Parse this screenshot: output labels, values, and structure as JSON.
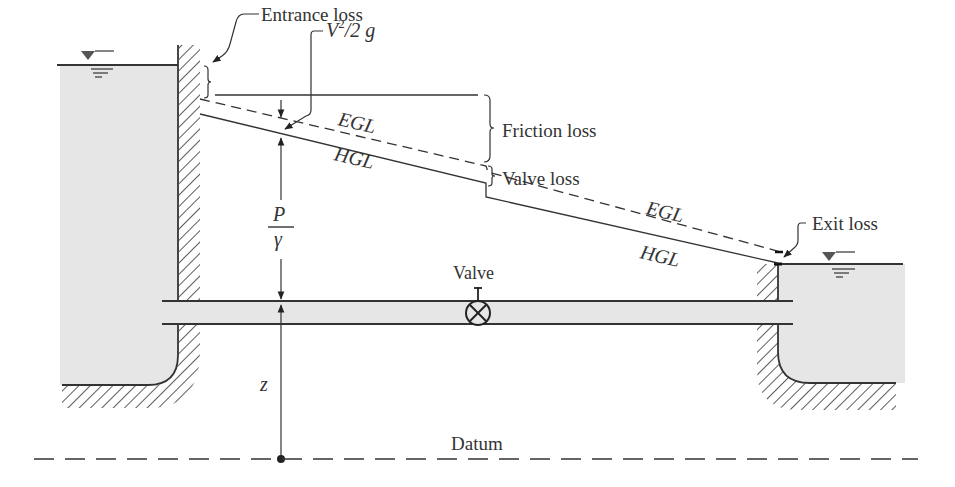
{
  "diagram": {
    "labels": {
      "entrance_loss": "Entrance loss",
      "velocity_head_v": "V",
      "velocity_head_exp": "2",
      "velocity_head_rest": "/2 g",
      "friction_loss": "Friction loss",
      "valve_loss": "Valve loss",
      "exit_loss": "Exit loss",
      "egl_upper": "EGL",
      "hgl_upper": "HGL",
      "egl_lower": "EGL",
      "hgl_lower": "HGL",
      "pressure_head_num": "P",
      "pressure_head_den": "γ",
      "elevation_head": "z",
      "valve": "Valve",
      "datum": "Datum"
    },
    "colors": {
      "line": "#333333",
      "water": "#e6e6e6",
      "background": "#ffffff"
    }
  }
}
